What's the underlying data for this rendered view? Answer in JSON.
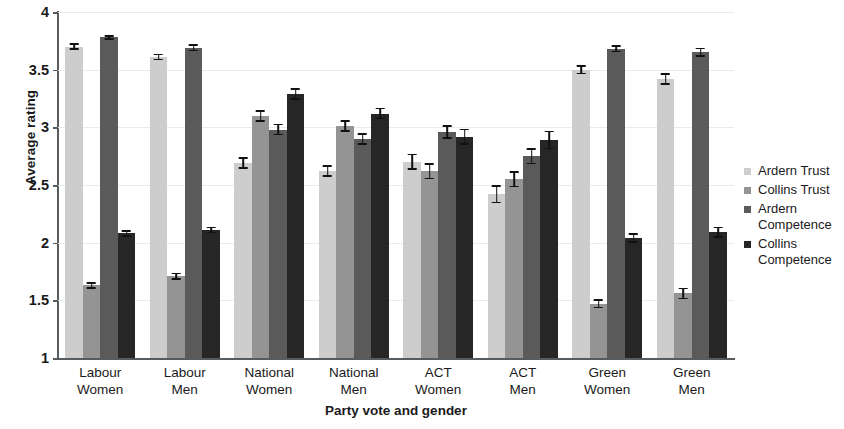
{
  "chart_data": {
    "type": "bar",
    "title": "",
    "xlabel": "Party vote and gender",
    "ylabel": "Average rating",
    "ylim": [
      1,
      4
    ],
    "ytick_labels": [
      "1",
      "1.5",
      "2",
      "2.5",
      "3",
      "3.5",
      "4"
    ],
    "ytick_values": [
      1,
      1.5,
      2,
      2.5,
      3,
      3.5,
      4
    ],
    "grid": true,
    "legend_position": "right",
    "categories": [
      "Labour Women",
      "Labour Men",
      "National Women",
      "National Men",
      "ACT Women",
      "ACT Men",
      "Green Women",
      "Green Men"
    ],
    "category_lines": [
      [
        "Labour",
        "Women"
      ],
      [
        "Labour",
        "Men"
      ],
      [
        "National",
        "Women"
      ],
      [
        "National",
        "Men"
      ],
      [
        "ACT",
        "Women"
      ],
      [
        "ACT",
        "Men"
      ],
      [
        "Green",
        "Women"
      ],
      [
        "Green",
        "Men"
      ]
    ],
    "series": [
      {
        "name": "Ardern Trust",
        "color": "#cdcdcd",
        "values": [
          3.7,
          3.61,
          2.69,
          2.62,
          2.7,
          2.42,
          3.5,
          3.42
        ],
        "errors": [
          0.03,
          0.03,
          0.05,
          0.05,
          0.07,
          0.08,
          0.04,
          0.05
        ]
      },
      {
        "name": "Collins Trust",
        "color": "#949494",
        "values": [
          1.63,
          1.71,
          3.1,
          3.01,
          2.62,
          2.55,
          1.47,
          1.56
        ],
        "errors": [
          0.03,
          0.03,
          0.05,
          0.05,
          0.07,
          0.07,
          0.04,
          0.05
        ]
      },
      {
        "name": "Ardern Competence",
        "color": "#5a5a5a",
        "values": [
          3.78,
          3.69,
          2.98,
          2.9,
          2.96,
          2.75,
          3.68,
          3.65
        ],
        "errors": [
          0.02,
          0.03,
          0.05,
          0.05,
          0.06,
          0.07,
          0.03,
          0.04
        ]
      },
      {
        "name": "Collins Competence",
        "color": "#262626",
        "values": [
          2.08,
          2.11,
          3.29,
          3.12,
          2.92,
          2.89,
          2.04,
          2.09
        ],
        "errors": [
          0.03,
          0.03,
          0.05,
          0.05,
          0.07,
          0.08,
          0.04,
          0.05
        ]
      }
    ],
    "legend": [
      {
        "label": "Ardern Trust",
        "color": "#cdcdcd"
      },
      {
        "label": "Collins Trust",
        "color": "#949494"
      },
      {
        "label": "Ardern Competence",
        "color": "#5a5a5a"
      },
      {
        "label": "Collins Competence",
        "color": "#262626"
      }
    ]
  }
}
